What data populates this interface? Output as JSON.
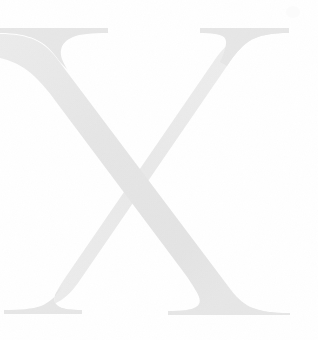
{
  "canvas": {
    "width": 318,
    "height": 340,
    "background_color": "#ffffff"
  },
  "artwork": {
    "kind": "decorative-letterform",
    "character": "X",
    "description": "Large serif capital letter X rendered as a very light gray watermark / drop cap on a plain white page",
    "style": "old-style serif capital with flared bracketed serifs",
    "ink_color": "#e7e7e7",
    "ink_color_shadow": "#dedede",
    "ink_color_highlight": "#efefef",
    "opacity": 1,
    "bounds": {
      "left": 0,
      "top": 28,
      "right": 290,
      "bottom": 315,
      "width": 290,
      "height": 287
    },
    "strokes": [
      {
        "name": "thick-diagonal",
        "direction": "top-left-to-bottom-right",
        "approx_width_px": 40,
        "label": "Thick stroke"
      },
      {
        "name": "thin-diagonal",
        "direction": "top-right-to-bottom-left",
        "approx_width_px": 7,
        "label": "Thin stroke"
      }
    ],
    "serifs": [
      {
        "name": "serif-top-left",
        "label": "Top left serif",
        "x_range": [
          0,
          108
        ],
        "y": 28
      },
      {
        "name": "serif-top-right",
        "label": "Top right serif",
        "x_range": [
          200,
          289
        ],
        "y": 28
      },
      {
        "name": "serif-bottom-left",
        "label": "Bottom left serif",
        "x_range": [
          4,
          82
        ],
        "y": 313
      },
      {
        "name": "serif-bottom-right",
        "label": "Bottom right serif",
        "x_range": [
          168,
          290
        ],
        "y": 315
      }
    ],
    "crossing_point": {
      "x": 152,
      "y": 168
    },
    "artifact": {
      "name": "corner-speck",
      "label": "Faint speck near top-right corner",
      "x": 286,
      "y": 6,
      "color": "#fbfbfb"
    }
  }
}
